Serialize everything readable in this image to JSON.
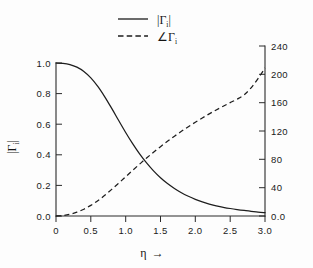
{
  "figure": {
    "background_color": "#fdfdfd",
    "ink_color": "#1d1d1d"
  },
  "legend": {
    "position": "top-center",
    "entries": [
      {
        "label": "|Γ",
        "sub": "i",
        "label_tail": "|",
        "style": "solid",
        "name": "magnitude"
      },
      {
        "label": "∠Γ",
        "sub": "i",
        "label_tail": "",
        "style": "dashed",
        "name": "phase"
      }
    ]
  },
  "axes": {
    "x": {
      "title": "η",
      "title_arrow": "→",
      "ticks": [
        "0",
        "0.5",
        "1.0",
        "1.5",
        "2.0",
        "2.5",
        "3.0"
      ],
      "values": [
        0,
        0.5,
        1.0,
        1.5,
        2.0,
        2.5,
        3.0
      ],
      "min": 0,
      "max": 3.0
    },
    "y_left": {
      "title": "|Γ",
      "title_sub": "i",
      "title_tail": "|",
      "ticks": [
        "0.0",
        "0.2",
        "0.4",
        "0.6",
        "0.8",
        "1.0"
      ],
      "values": [
        0.0,
        0.2,
        0.4,
        0.6,
        0.8,
        1.0
      ],
      "min": 0.0,
      "max": 1.0
    },
    "y_right": {
      "ticks": [
        "0.0",
        "40",
        "80",
        "120",
        "160",
        "200",
        "240"
      ],
      "values": [
        0,
        40,
        80,
        120,
        160,
        200,
        240
      ],
      "min": 0,
      "max": 240
    }
  },
  "chart_data": {
    "type": "line",
    "title": "",
    "xlabel": "η →",
    "ylabel": "|Γi|",
    "y2label": "∠Γi (degrees)",
    "xlim": [
      0,
      3.0
    ],
    "ylim": [
      0.0,
      1.0
    ],
    "y2lim": [
      0,
      240
    ],
    "grid": false,
    "legend_position": "top-center",
    "x": [
      0.0,
      0.1,
      0.2,
      0.3,
      0.4,
      0.5,
      0.6,
      0.7,
      0.8,
      0.9,
      1.0,
      1.1,
      1.2,
      1.3,
      1.4,
      1.5,
      1.6,
      1.7,
      1.8,
      1.9,
      2.0,
      2.1,
      2.2,
      2.3,
      2.4,
      2.5,
      2.6,
      2.7,
      2.8,
      2.9,
      3.0
    ],
    "series": [
      {
        "name": "|Γi|",
        "axis": "left",
        "style": "solid",
        "color": "#1d1d1d",
        "values": [
          1.0,
          0.998,
          0.99,
          0.973,
          0.945,
          0.903,
          0.847,
          0.779,
          0.703,
          0.624,
          0.546,
          0.473,
          0.406,
          0.347,
          0.295,
          0.25,
          0.212,
          0.18,
          0.152,
          0.129,
          0.109,
          0.092,
          0.078,
          0.066,
          0.057,
          0.049,
          0.042,
          0.036,
          0.031,
          0.026,
          0.022
        ]
      },
      {
        "name": "∠Γi",
        "axis": "right",
        "style": "dashed",
        "color": "#1d1d1d",
        "values": [
          0,
          0.6,
          2.4,
          5.4,
          9.6,
          15.0,
          21.6,
          29.2,
          37.6,
          46.4,
          55.4,
          64.4,
          73.2,
          81.8,
          90.0,
          97.9,
          105.4,
          112.6,
          119.5,
          126.1,
          132.4,
          138.4,
          144.2,
          149.7,
          155.0,
          160.1,
          165.0,
          171.0,
          181.0,
          194.0,
          209.0
        ]
      }
    ],
    "annotations": [
      {
        "text": "curves cross",
        "x": 1.15,
        "y": 0.42
      }
    ]
  }
}
